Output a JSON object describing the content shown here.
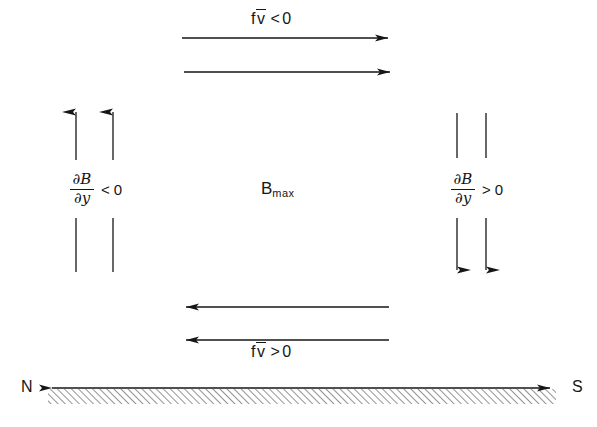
{
  "figure": {
    "name": "meridional-flow-magnetic-gradient-diagram",
    "background_color": "#ffffff",
    "ink_color": "#161616",
    "width": 597,
    "height": 427
  },
  "labels": {
    "top_flux": {
      "symbol_f": "f",
      "symbol_v": "v",
      "overbar": true,
      "operator": "<",
      "value": "0",
      "text": "f v̄ < 0"
    },
    "bottom_flux": {
      "symbol_f": "f",
      "symbol_v": "v",
      "overbar": true,
      "operator": ">",
      "value": "0",
      "text": "f v̄ > 0"
    },
    "center": {
      "base": "B",
      "subscript": "max",
      "text": "B max"
    },
    "left_derivative": {
      "numerator": "∂B",
      "denominator": "∂y",
      "partial_symbol": "∂",
      "numerator_var": "B",
      "denominator_var": "y",
      "operator": "<",
      "value": "0",
      "text": "∂B/∂y < 0"
    },
    "right_derivative": {
      "numerator": "∂B",
      "denominator": "∂y",
      "partial_symbol": "∂",
      "numerator_var": "B",
      "denominator_var": "y",
      "operator": ">",
      "value": "0",
      "text": "∂B/∂y > 0"
    },
    "compass_north": "N",
    "compass_south": "S"
  },
  "arrows": {
    "top": [
      {
        "name": "top-arrow-upper",
        "direction": "right",
        "x1": 182,
        "y": 38,
        "x2": 388
      },
      {
        "name": "top-arrow-lower",
        "direction": "right",
        "x1": 184,
        "y": 72,
        "x2": 390
      }
    ],
    "bottom": [
      {
        "name": "bottom-arrow-upper",
        "direction": "left",
        "x1": 389,
        "y": 307,
        "x2": 186
      },
      {
        "name": "bottom-arrow-lower",
        "direction": "left",
        "x1": 389,
        "y": 340,
        "x2": 186
      }
    ],
    "left": [
      {
        "name": "left-arrow-outer",
        "direction": "up",
        "x": 76,
        "y_top": 112,
        "y_break_top": 160,
        "y_break_bottom": 218,
        "y_bottom": 272
      },
      {
        "name": "left-arrow-inner",
        "direction": "up",
        "x": 113,
        "y_top": 112,
        "y_break_top": 160,
        "y_break_bottom": 218,
        "y_bottom": 272
      }
    ],
    "right": [
      {
        "name": "right-arrow-inner",
        "direction": "down",
        "x": 457,
        "y_top": 113,
        "y_break_top": 158,
        "y_break_bottom": 218,
        "y_bottom": 270
      },
      {
        "name": "right-arrow-outer",
        "direction": "down",
        "x": 486,
        "y_top": 113,
        "y_break_top": 158,
        "y_break_bottom": 218,
        "y_bottom": 270
      }
    ],
    "axis": {
      "name": "ground-axis",
      "direction": "both",
      "x1": 40,
      "x2": 562,
      "y": 388
    }
  },
  "ground": {
    "hatch_angle_degrees": 45,
    "hatch_spacing": 5,
    "hatch_depth": 15,
    "x_start": 48,
    "x_end": 556,
    "y": 389
  }
}
